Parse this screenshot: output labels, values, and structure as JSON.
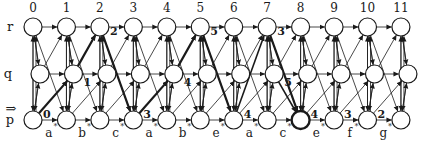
{
  "diagram": {
    "type": "trellis-state-transition",
    "rows": [
      {
        "id": "r",
        "label": "r"
      },
      {
        "id": "q",
        "label": "q"
      },
      {
        "id": "p",
        "label": "p",
        "start": true
      }
    ],
    "start_marker": "⇒",
    "columns": [
      "0",
      "1",
      "2",
      "3",
      "4",
      "5",
      "6",
      "7",
      "8",
      "9",
      "10",
      "11"
    ],
    "input_symbols": [
      "a",
      "b",
      "c",
      "a",
      "b",
      "e",
      "a",
      "c",
      "e",
      "f",
      "g"
    ],
    "step_marks": [
      {
        "row": "p",
        "col": 0,
        "label": "0"
      },
      {
        "row": "q",
        "col": 1,
        "label": "1"
      },
      {
        "row": "r",
        "col": 2,
        "label": "2"
      },
      {
        "row": "p",
        "col": 3,
        "label": "3"
      },
      {
        "row": "q",
        "col": 4,
        "label": "4"
      },
      {
        "row": "r",
        "col": 5,
        "label": "5"
      },
      {
        "row": "p",
        "col": 6,
        "label": "4"
      },
      {
        "row": "r",
        "col": 7,
        "label": "3"
      },
      {
        "row": "q",
        "col": 7,
        "label": "5"
      },
      {
        "row": "p",
        "col": 8,
        "label": "4"
      },
      {
        "row": "p",
        "col": 9,
        "label": "3"
      },
      {
        "row": "p",
        "col": 10,
        "label": "2"
      }
    ],
    "bold_nodes": [
      {
        "row": "p",
        "col": 8
      }
    ],
    "colors": {
      "line": "#1a1a1a",
      "background": "#ffffff"
    }
  }
}
